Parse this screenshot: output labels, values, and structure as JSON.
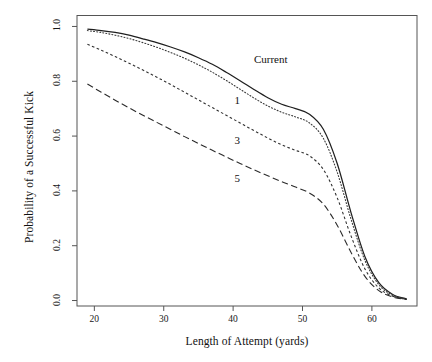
{
  "chart_data": {
    "type": "line",
    "title": "",
    "xlabel": "Length of Attempt (yards)",
    "ylabel": "Probability of a Successful Kick",
    "xlim": [
      17.5,
      66.5
    ],
    "ylim": [
      -0.02,
      1.04
    ],
    "grid": false,
    "legend": "inline-curve-labels",
    "xticks": [
      20,
      30,
      40,
      50,
      60
    ],
    "xtick_labels": [
      "20",
      "30",
      "40",
      "50",
      "60"
    ],
    "yticks": [
      0.0,
      0.2,
      0.4,
      0.6,
      0.8,
      1.0
    ],
    "ytick_labels": [
      "0.0",
      "0.2",
      "0.4",
      "0.6",
      "0.8",
      "1.0"
    ],
    "x": [
      19,
      21,
      23,
      25,
      27,
      29,
      31,
      33,
      35,
      37,
      39,
      41,
      43,
      45,
      47,
      49,
      51,
      53,
      55,
      57,
      59,
      61,
      63,
      65
    ],
    "series": [
      {
        "name": "Current",
        "style": "solid",
        "color": "#1f1f1f",
        "label": "Current",
        "label_x": 43,
        "label_y": 0.875,
        "values": [
          0.99,
          0.985,
          0.978,
          0.968,
          0.955,
          0.941,
          0.925,
          0.907,
          0.886,
          0.862,
          0.833,
          0.802,
          0.77,
          0.74,
          0.716,
          0.7,
          0.68,
          0.625,
          0.5,
          0.32,
          0.16,
          0.065,
          0.022,
          0.006
        ]
      },
      {
        "name": "1",
        "style": "dotted",
        "color": "#3a3a3a",
        "label": "1",
        "label_x": 40.2,
        "label_y": 0.725,
        "values": [
          0.985,
          0.978,
          0.968,
          0.956,
          0.941,
          0.924,
          0.905,
          0.884,
          0.86,
          0.833,
          0.803,
          0.771,
          0.739,
          0.71,
          0.687,
          0.67,
          0.648,
          0.592,
          0.468,
          0.296,
          0.146,
          0.058,
          0.019,
          0.005
        ]
      },
      {
        "name": "3",
        "style": "dashed-short",
        "color": "#303030",
        "label": "3",
        "label_x": 40.2,
        "label_y": 0.578,
        "values": [
          0.935,
          0.913,
          0.89,
          0.866,
          0.841,
          0.815,
          0.788,
          0.76,
          0.732,
          0.704,
          0.676,
          0.648,
          0.62,
          0.593,
          0.568,
          0.548,
          0.528,
          0.478,
          0.375,
          0.235,
          0.115,
          0.046,
          0.016,
          0.004
        ]
      },
      {
        "name": "5",
        "style": "dashed-long",
        "color": "#2b2b2b",
        "label": "5",
        "label_x": 40.2,
        "label_y": 0.438,
        "values": [
          0.79,
          0.76,
          0.731,
          0.703,
          0.676,
          0.65,
          0.624,
          0.598,
          0.573,
          0.548,
          0.524,
          0.5,
          0.477,
          0.455,
          0.434,
          0.414,
          0.392,
          0.352,
          0.275,
          0.175,
          0.088,
          0.036,
          0.013,
          0.004
        ]
      }
    ]
  }
}
